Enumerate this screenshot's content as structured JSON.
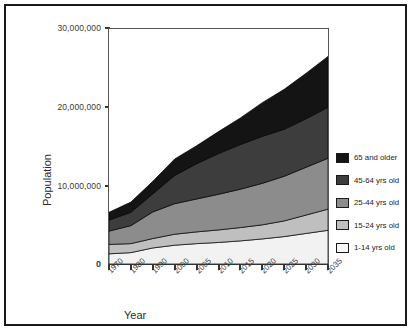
{
  "chart_data": {
    "type": "area",
    "stacked": true,
    "title": "",
    "xlabel": "Year",
    "ylabel": "Population",
    "categories": [
      "1970",
      "1980",
      "1990",
      "2000",
      "2005",
      "2010",
      "2015",
      "2020",
      "2025",
      "2030",
      "2035"
    ],
    "ylim": [
      0,
      30000000
    ],
    "yticks": [
      0,
      10000000,
      20000000,
      30000000
    ],
    "ytick_labels": [
      "0",
      "10,000,000",
      "20,000,000",
      "30,000,000"
    ],
    "grid": false,
    "legend_position": "right",
    "series": [
      {
        "name": "1-14 yrs old",
        "color": "#f2f2f2",
        "values": [
          1300000,
          1450000,
          2050000,
          2400000,
          2600000,
          2750000,
          2950000,
          3200000,
          3500000,
          3900000,
          4300000
        ]
      },
      {
        "name": "15-24 yrs old",
        "color": "#bfbfbf",
        "values": [
          1200000,
          1150000,
          1200000,
          1400000,
          1500000,
          1600000,
          1700000,
          1800000,
          2000000,
          2350000,
          2700000
        ]
      },
      {
        "name": "25-44 yrs old",
        "color": "#8c8c8c",
        "values": [
          1700000,
          2300000,
          3400000,
          3900000,
          4200000,
          4550000,
          4900000,
          5300000,
          5700000,
          6100000,
          6500000
        ]
      },
      {
        "name": "45-64 yrs old",
        "color": "#3d3d3d",
        "values": [
          1400000,
          1700000,
          2300000,
          3600000,
          4500000,
          5200000,
          5700000,
          6000000,
          6000000,
          6200000,
          6500000
        ]
      },
      {
        "name": "65 and older",
        "color": "#141414",
        "values": [
          1000000,
          1300000,
          1600000,
          2100000,
          2300000,
          2800000,
          3400000,
          4300000,
          5100000,
          5800000,
          6500000
        ]
      }
    ],
    "cumulative_tops": {
      "1-14 yrs old": [
        1300000,
        1450000,
        2050000,
        2400000,
        2600000,
        2750000,
        2950000,
        3200000,
        3500000,
        3900000,
        4300000
      ],
      "15-24 yrs old": [
        2500000,
        2600000,
        3250000,
        3800000,
        4100000,
        4350000,
        4650000,
        5000000,
        5500000,
        6250000,
        7000000
      ],
      "25-44 yrs old": [
        4200000,
        4900000,
        6650000,
        7700000,
        8300000,
        8900000,
        9550000,
        10300000,
        11200000,
        12350000,
        13500000
      ],
      "45-64 yrs old": [
        5600000,
        6600000,
        8950000,
        11300000,
        12800000,
        14100000,
        15250000,
        16300000,
        17200000,
        18550000,
        20000000
      ],
      "65 and older": [
        6600000,
        7900000,
        10550000,
        13400000,
        15100000,
        16900000,
        18650000,
        20600000,
        22300000,
        24350000,
        26500000
      ]
    }
  },
  "axes": {
    "ylabel": "Population",
    "xlabel": "Year",
    "ytick_30": "30,000,000",
    "ytick_20": "20,000,000",
    "ytick_10": "10,000,000",
    "ytick_0": "0"
  },
  "legend": {
    "items": [
      {
        "label": "65 and older",
        "color": "#141414"
      },
      {
        "label": "45-64 yrs old",
        "color": "#3d3d3d"
      },
      {
        "label": "25-44 yrs old",
        "color": "#8c8c8c"
      },
      {
        "label": "15-24 yrs old",
        "color": "#bfbfbf"
      },
      {
        "label": "1-14 yrs old",
        "color": "#f7f7f7"
      }
    ]
  }
}
